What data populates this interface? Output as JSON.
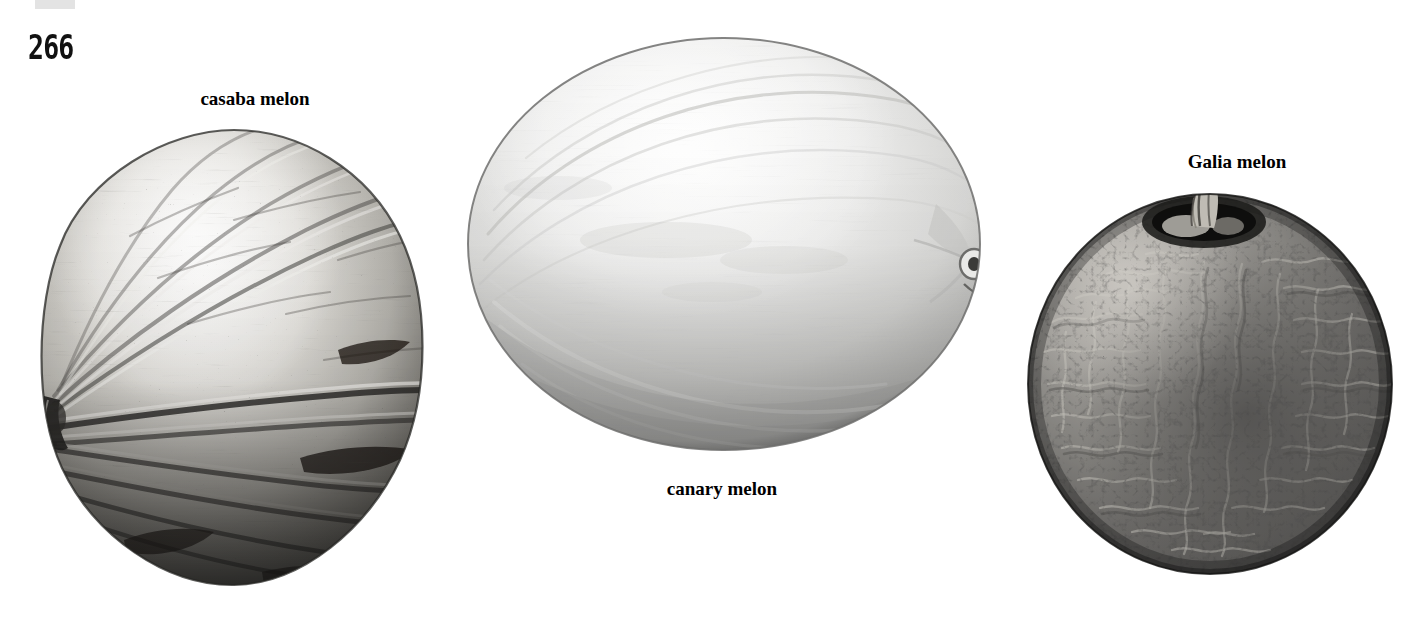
{
  "page": {
    "folio": "266",
    "background_color": "#ffffff",
    "top_marker_color": "#e3e3e3"
  },
  "plate": {
    "title": "",
    "figures": [
      {
        "id": "casaba",
        "caption": "casaba melon",
        "shape": "wrinkled-round",
        "surface": "deeply furrowed, speckled with dark flecks",
        "tone": "light grey with dark shaded lower half",
        "stem_position": "left",
        "fill_light": "#f2f1ef",
        "fill_mid": "#9b9994",
        "fill_dark": "#2e2d2b"
      },
      {
        "id": "canary",
        "caption": "canary melon",
        "shape": "smooth-oval",
        "surface": "smooth, faint longitudinal striations",
        "tone": "very pale grey, darker underside",
        "stem_position": "right blossom scar",
        "fill_light": "#f7f7f6",
        "fill_mid": "#d2d2d0",
        "fill_dark": "#8e8e8c"
      },
      {
        "id": "galia",
        "caption": "Galia melon",
        "shape": "netted-sphere",
        "surface": "dense corky netting / reticulation",
        "tone": "dark charcoal grey, lit upper left",
        "stem_position": "top, in sunken cavity",
        "fill_light": "#8d8b87",
        "fill_mid": "#4b4a48",
        "fill_dark": "#161615"
      }
    ]
  }
}
